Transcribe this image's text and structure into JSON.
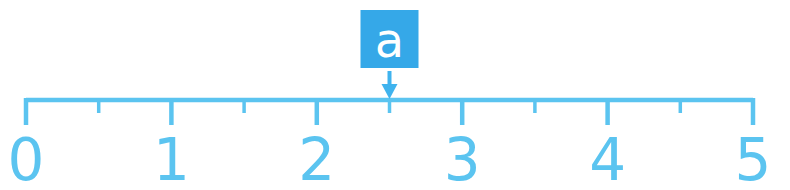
{
  "figure": {
    "kind": "number-line",
    "background_color": "#ffffff",
    "line_color": "#5bc4f0",
    "label_color": "#5bc4f0",
    "marker_box_color": "#35a8e8",
    "marker_text_color": "#ffffff",
    "arrow_color": "#3fb3ee"
  },
  "axis": {
    "min": 0,
    "max": 5,
    "major_step": 1,
    "minor_step": 0.5,
    "tick_labels": [
      "0",
      "1",
      "2",
      "3",
      "4",
      "5"
    ],
    "major_tick_values": [
      0,
      1,
      2,
      3,
      4,
      5
    ],
    "minor_tick_values": [
      0.5,
      1.5,
      2.5,
      3.5,
      4.5
    ]
  },
  "marker": {
    "label": "a",
    "value": 2.5,
    "arrow": "down-arrow"
  },
  "chart_data": {
    "type": "line",
    "title": "",
    "xlabel": "",
    "ylabel": "",
    "xlim": [
      0,
      5
    ],
    "grid": false,
    "categories": [
      "0",
      "1",
      "2",
      "3",
      "4",
      "5"
    ],
    "values": [
      0,
      1,
      2,
      3,
      4,
      5
    ],
    "annotations": [
      {
        "text": "a",
        "x": 2.5,
        "y": 0,
        "style": "boxed-label-with-down-arrow"
      }
    ]
  }
}
